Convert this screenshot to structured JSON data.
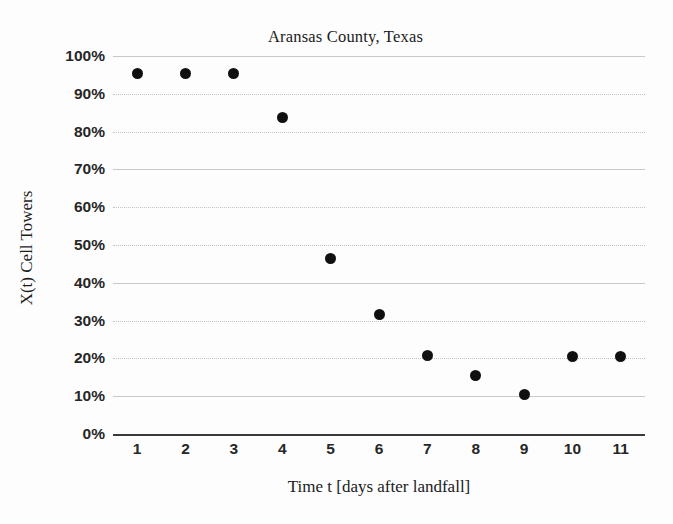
{
  "chart_data": {
    "type": "scatter",
    "title": "Aransas County, Texas",
    "xlabel": "Time t [days after landfall]",
    "ylabel": "X(t) Cell Towers",
    "x": [
      1,
      2,
      3,
      4,
      5,
      6,
      7,
      8,
      9,
      10,
      11
    ],
    "categories": [
      "1",
      "2",
      "3",
      "4",
      "5",
      "6",
      "7",
      "8",
      "9",
      "10",
      "11"
    ],
    "values": [
      95.4,
      95.4,
      95.4,
      83.8,
      46.4,
      31.6,
      20.7,
      15.4,
      10.5,
      20.6,
      20.6
    ],
    "series": [
      {
        "name": "X(t) Cell Towers",
        "values": [
          95.4,
          95.4,
          95.4,
          83.8,
          46.4,
          31.6,
          20.7,
          15.4,
          10.5,
          20.6,
          20.6
        ]
      }
    ],
    "ylim": [
      0,
      100
    ],
    "xlim": [
      0.5,
      11.5
    ],
    "ytick_labels": [
      "100%",
      "90%",
      "80%",
      "70%",
      "60%",
      "50%",
      "40%",
      "30%",
      "20%",
      "10%",
      "0%"
    ],
    "ytick_values": [
      100,
      90,
      80,
      70,
      60,
      50,
      40,
      30,
      20,
      10,
      0
    ],
    "grid": true,
    "grid_axis": "y",
    "legend": false,
    "legend_position": "none",
    "marker": "circle",
    "marker_color": "#101010",
    "gridline_color": "#c9c9c9",
    "axis_color": "#3a3a3a",
    "background_color": "#ffffff"
  }
}
